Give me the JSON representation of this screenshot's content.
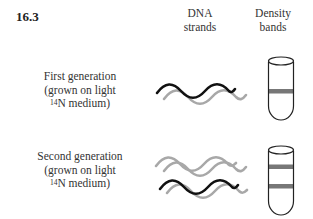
{
  "figure_number": "16.3",
  "columns": {
    "dna": {
      "line1": "DNA",
      "line2": "strands"
    },
    "density": {
      "line1": "Density",
      "line2": "bands"
    }
  },
  "rows": [
    {
      "label_line1": "First generation",
      "label_line2": "(grown on light",
      "label_sup": "14",
      "label_line3": "N medium)",
      "strands": [
        "heavy (black)",
        "light (gray)"
      ],
      "bands": [
        "intermediate"
      ]
    },
    {
      "label_line1": "Second generation",
      "label_line2": "(grown on light",
      "label_sup": "14",
      "label_line3": "N medium)",
      "strands": [
        "light (gray)",
        "light (gray)",
        "heavy (black)",
        "light (gray)"
      ],
      "bands": [
        "light",
        "intermediate"
      ]
    }
  ],
  "colors": {
    "heavy_strand": "#111111",
    "light_strand": "#a8a8a8",
    "band": "#777777",
    "tube_outline": "#222222"
  }
}
